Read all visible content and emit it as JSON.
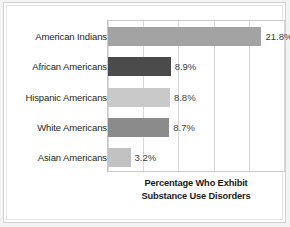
{
  "chart_data": {
    "type": "bar",
    "orientation": "horizontal",
    "title": "",
    "xlabel": "Percentage Who Exhibit Substance Use Disorders",
    "ylabel": "",
    "categories": [
      "American Indians",
      "African Americans",
      "Hispanic Americans",
      "White Americans",
      "Asian Americans"
    ],
    "values": [
      21.8,
      8.9,
      8.8,
      8.7,
      3.2
    ],
    "value_labels": [
      "21.8%",
      "8.9%",
      "8.8%",
      "8.7%",
      "3.2%"
    ],
    "bar_colors": [
      "#a3a3a3",
      "#4b4b4b",
      "#c9c9c9",
      "#8b8b8b",
      "#c2c2c2"
    ],
    "xlim": [
      0,
      25
    ],
    "gridlines": [
      0,
      5,
      10,
      15,
      20,
      25
    ],
    "grid": true,
    "tick_labels_visible": false,
    "legend": null
  },
  "caption": {
    "line1": "Percentage Who Exhibit",
    "line2": "Substance Use Disorders"
  }
}
